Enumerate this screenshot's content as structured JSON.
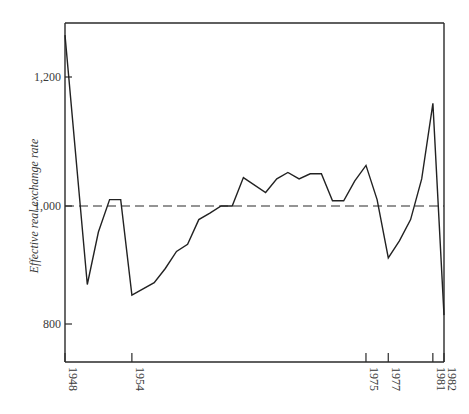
{
  "chart_data": {
    "type": "line",
    "title": "",
    "xlabel": "",
    "ylabel": "Effective real exchange rate",
    "x_range": [
      1948,
      1982
    ],
    "ylim": [
      740,
      1290
    ],
    "grid": false,
    "legend": null,
    "x_tick_labels": [
      "1948",
      "1954",
      "1975",
      "1977",
      "1981",
      "1982"
    ],
    "x_ticks": [
      1948,
      1954,
      1975,
      1977,
      1981,
      1982
    ],
    "y_tick_labels": [
      "1,200",
      "1,000",
      "800"
    ],
    "y_ticks": [
      1200,
      1000,
      800
    ],
    "reference_line": {
      "value": 1000,
      "style": "dashed"
    },
    "series": [
      {
        "name": "Effective real exchange rate",
        "x": [
          1948,
          1950,
          1951,
          1952,
          1953,
          1954,
          1956,
          1957,
          1958,
          1959,
          1960,
          1961,
          1962,
          1963,
          1964,
          1966,
          1967,
          1968,
          1969,
          1970,
          1971,
          1972,
          1973,
          1974,
          1975,
          1976,
          1977,
          1978,
          1979,
          1980,
          1981,
          1982
        ],
        "values": [
          1265,
          867,
          956,
          1010,
          1010,
          849,
          870,
          894,
          923,
          935,
          977,
          988,
          1000,
          1000,
          1044,
          1021,
          1042,
          1052,
          1042,
          1050,
          1050,
          1008,
          1008,
          1039,
          1063,
          1010,
          912,
          941,
          977,
          1042,
          1159,
          815
        ]
      }
    ]
  }
}
